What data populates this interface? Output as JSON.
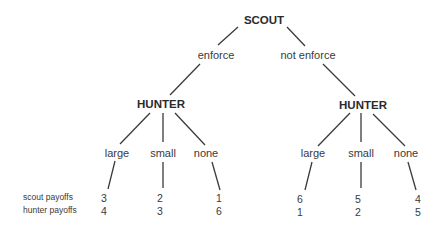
{
  "tree": {
    "root": {
      "label": "SCOUT"
    },
    "scout_actions": [
      {
        "label": "enforce"
      },
      {
        "label": "not enforce"
      }
    ],
    "hunter_nodes": [
      {
        "label": "HUNTER"
      },
      {
        "label": "HUNTER"
      }
    ],
    "hunter_actions": [
      [
        "large",
        "small",
        "none"
      ],
      [
        "large",
        "small",
        "none"
      ]
    ]
  },
  "payoffs": {
    "row_labels": {
      "scout": "scout payoffs",
      "hunter": "hunter payoffs"
    },
    "scout": [
      "3",
      "2",
      "1",
      "6",
      "5",
      "4"
    ],
    "hunter": [
      "4",
      "3",
      "6",
      "1",
      "2",
      "5"
    ]
  }
}
